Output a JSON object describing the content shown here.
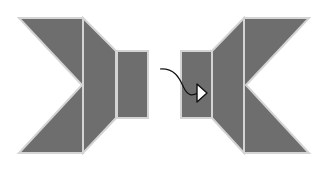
{
  "diagram": {
    "colors": {
      "fill": "#6e6e6e",
      "stroke": "#d4d4d4",
      "background": "#ffffff",
      "arrow": "#111111",
      "arrowhead_fill": "#ffffff"
    },
    "left_figure": {
      "pieces": [
        {
          "name": "left-big-piece",
          "points": "19,18 83,18 83,153 19,153 82,85"
        },
        {
          "name": "left-trapezoid",
          "points": "83,18 116,51 116,118 83,153"
        },
        {
          "name": "left-rectangle",
          "points": "117,51 148,51 148,118 117,118"
        }
      ]
    },
    "right_figure": {
      "pieces": [
        {
          "name": "right-rectangle",
          "points": "181,51 212,51 212,118 181,118"
        },
        {
          "name": "right-trapezoid",
          "points": "212,51 244,18 244,153 212,118"
        },
        {
          "name": "right-big-piece",
          "points": "244,18 309,18 246,85 309,153 244,153"
        }
      ]
    },
    "arrow": {
      "path": "M160,69 C176,68 180,80 184,88 C188,96 192,96 198,93",
      "head": "197,84 207,93 197,102"
    }
  }
}
